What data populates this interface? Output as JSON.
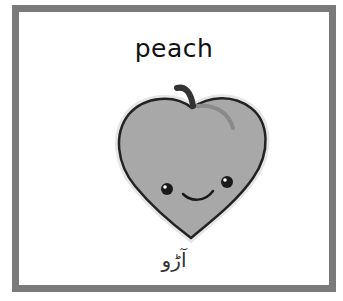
{
  "card": {
    "title": "peach",
    "translation": "آڑو",
    "image": "peach-character-icon",
    "border_color": "#7a7a7a",
    "fruit_color": "#a8a8a8"
  }
}
